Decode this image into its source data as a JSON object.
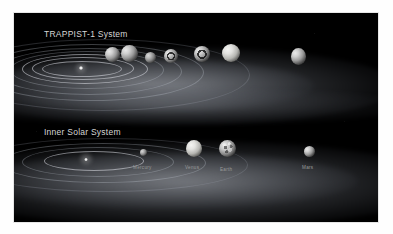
{
  "figure": {
    "background_color": "#000000",
    "page_color": "#ffffff",
    "label_color": "#cfcfcf"
  },
  "systems": [
    {
      "id": "trappist-1",
      "title": "TRAPPIST-1 System",
      "star_name": "TRAPPIST-1",
      "planet_count": 7,
      "planets": [
        {
          "name": "b"
        },
        {
          "name": "c"
        },
        {
          "name": "d"
        },
        {
          "name": "e"
        },
        {
          "name": "f"
        },
        {
          "name": "g"
        },
        {
          "name": "h"
        }
      ]
    },
    {
      "id": "inner-solar-system",
      "title": "Inner Solar System",
      "star_name": "Sun",
      "planet_count": 4,
      "planets": [
        {
          "name": "Mercury",
          "label": "Mercury"
        },
        {
          "name": "Venus",
          "label": "Venus"
        },
        {
          "name": "Earth",
          "label": "Earth"
        },
        {
          "name": "Mars",
          "label": "Mars"
        }
      ]
    }
  ],
  "labels": {
    "trappist_title": "TRAPPIST-1 System",
    "solar_title": "Inner Solar System",
    "mercury": "Mercury",
    "venus": "Venus",
    "earth": "Earth",
    "mars": "Mars"
  }
}
